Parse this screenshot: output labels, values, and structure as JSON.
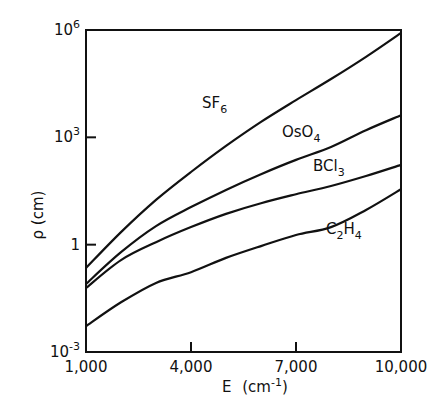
{
  "chart_data": {
    "type": "line",
    "title": "",
    "xlabel": "E (cm⁻¹)",
    "ylabel": "ρ (cm)",
    "xscale": "linear",
    "yscale": "log",
    "xlim": [
      1000,
      10000
    ],
    "ylim": [
      0.001,
      1000000
    ],
    "x_ticks": [
      1000,
      4000,
      7000,
      10000
    ],
    "x_tick_labels": [
      "1,000",
      "4,000",
      "7,000",
      "10,000"
    ],
    "y_ticks": [
      0.001,
      1,
      1000,
      1000000
    ],
    "y_tick_labels": [
      {
        "base": "10",
        "exp": "-3"
      },
      {
        "base": "1",
        "exp": ""
      },
      {
        "base": "10",
        "exp": "3"
      },
      {
        "base": "10",
        "exp": "6"
      }
    ],
    "grid": false,
    "legend": "inline curve labels",
    "x": [
      1000,
      2000,
      3000,
      4000,
      5000,
      6000,
      7000,
      8000,
      9000,
      10000
    ],
    "series": [
      {
        "name": "SF6",
        "label_base": "SF",
        "label_sub": "6",
        "log10_values": [
          -0.65,
          0.35,
          1.25,
          2.03,
          2.76,
          3.43,
          4.04,
          4.63,
          5.25,
          5.92
        ],
        "values": [
          0.22,
          2.2,
          18,
          107,
          575,
          2700,
          11000,
          43000,
          178000,
          830000
        ],
        "label_pos": [
          202,
          108
        ]
      },
      {
        "name": "OsO4",
        "label_base": "OsO",
        "label_sub": "4",
        "log10_values": [
          -1.1,
          -0.21,
          0.52,
          1.05,
          1.53,
          1.97,
          2.37,
          2.73,
          3.2,
          3.62
        ],
        "values": [
          0.079,
          0.62,
          3.3,
          11,
          34,
          93,
          234,
          537,
          1580,
          4200
        ],
        "label_pos": [
          282,
          137
        ]
      },
      {
        "name": "BCl3",
        "label_base": "BCl",
        "label_sub": "3",
        "log10_values": [
          -1.21,
          -0.43,
          0.07,
          0.49,
          0.86,
          1.16,
          1.41,
          1.64,
          1.92,
          2.23
        ],
        "values": [
          0.062,
          0.37,
          1.2,
          3.1,
          7.2,
          14,
          26,
          44,
          83,
          170
        ],
        "label_pos": [
          313,
          171
        ]
      },
      {
        "name": "C2H4",
        "label_base": "C",
        "label_sub": "2",
        "label_tail": "H",
        "label_sub2": "4",
        "log10_values": [
          -2.28,
          -1.61,
          -1.07,
          -0.77,
          -0.37,
          -0.04,
          0.27,
          0.49,
          0.97,
          1.55
        ],
        "values": [
          0.0052,
          0.025,
          0.085,
          0.17,
          0.43,
          0.91,
          1.9,
          3.1,
          9.3,
          35
        ],
        "label_pos": [
          326,
          234
        ]
      }
    ]
  },
  "axes": {
    "x_title": "E",
    "x_unit_open": "(cm",
    "x_unit_exp": "-1",
    "x_unit_close": ")",
    "y_title": "ρ (cm)"
  }
}
